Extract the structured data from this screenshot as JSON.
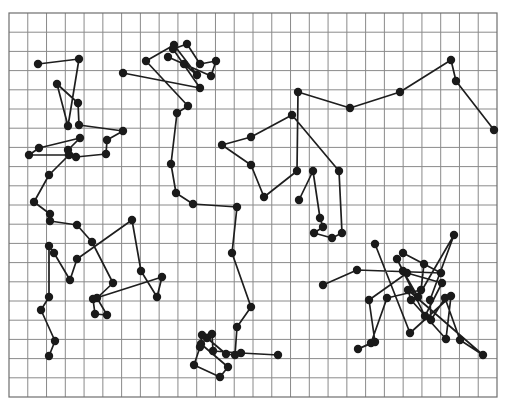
{
  "diagram": {
    "title": "",
    "type": "random-walk-trajectories-on-grid",
    "background": "#ffffff",
    "grid": {
      "x0": 9,
      "y0": 13,
      "x1": 497,
      "y1": 397,
      "cols": 26,
      "rows": 20,
      "color": "#8a8a8a"
    },
    "node_color": "#1a1a1a",
    "line_color": "#1e1e1e",
    "node_radius": 4.2,
    "trajectories": [
      {
        "name": "track-top-left",
        "points": [
          [
            38,
            64
          ],
          [
            79,
            59
          ],
          [
            68,
            126
          ],
          [
            57,
            84
          ],
          [
            78,
            103
          ],
          [
            79,
            125
          ],
          [
            123,
            131
          ],
          [
            107,
            140
          ],
          [
            106,
            154
          ],
          [
            76,
            157
          ],
          [
            68,
            150
          ],
          [
            80,
            138
          ],
          [
            39,
            148
          ],
          [
            29,
            155
          ],
          [
            69,
            155
          ],
          [
            49,
            175
          ],
          [
            34,
            202
          ],
          [
            50,
            214
          ]
        ]
      },
      {
        "name": "track-top-center",
        "points": [
          [
            123,
            73
          ],
          [
            200,
            88
          ],
          [
            173,
            49
          ],
          [
            187,
            44
          ],
          [
            200,
            64
          ],
          [
            216,
            61
          ],
          [
            211,
            76
          ],
          [
            168,
            57
          ],
          [
            184,
            64
          ],
          [
            197,
            75
          ],
          [
            174,
            45
          ],
          [
            146,
            61
          ],
          [
            188,
            106
          ],
          [
            177,
            113
          ],
          [
            171,
            164
          ],
          [
            176,
            193
          ],
          [
            193,
            204
          ],
          [
            237,
            207
          ],
          [
            232,
            253
          ],
          [
            251,
            307
          ],
          [
            237,
            327
          ],
          [
            235,
            355
          ],
          [
            226,
            354
          ],
          [
            207,
            338
          ],
          [
            201,
            344
          ],
          [
            228,
            367
          ],
          [
            220,
            377
          ],
          [
            194,
            365
          ],
          [
            200,
            347
          ],
          [
            202,
            335
          ],
          [
            212,
            334
          ],
          [
            213,
            351
          ],
          [
            241,
            353
          ],
          [
            278,
            355
          ]
        ]
      },
      {
        "name": "track-top-right",
        "points": [
          [
            494,
            130
          ],
          [
            456,
            81
          ],
          [
            451,
            60
          ],
          [
            400,
            92
          ],
          [
            350,
            108
          ],
          [
            298,
            92
          ],
          [
            297,
            171
          ],
          [
            264,
            197
          ],
          [
            251,
            165
          ],
          [
            222,
            145
          ],
          [
            251,
            137
          ],
          [
            292,
            115
          ],
          [
            339,
            171
          ],
          [
            342,
            233
          ],
          [
            332,
            238
          ],
          [
            314,
            233
          ],
          [
            323,
            227
          ],
          [
            320,
            218
          ],
          [
            313,
            171
          ],
          [
            299,
            200
          ]
        ]
      },
      {
        "name": "track-bottom-left",
        "points": [
          [
            50,
            221
          ],
          [
            77,
            225
          ],
          [
            92,
            242
          ],
          [
            113,
            283
          ],
          [
            97,
            298
          ],
          [
            107,
            315
          ],
          [
            95,
            314
          ],
          [
            93,
            299
          ],
          [
            162,
            277
          ],
          [
            157,
            297
          ],
          [
            141,
            271
          ],
          [
            132,
            220
          ],
          [
            77,
            259
          ],
          [
            70,
            280
          ],
          [
            54,
            253
          ],
          [
            49,
            246
          ],
          [
            49,
            297
          ],
          [
            41,
            310
          ],
          [
            55,
            341
          ],
          [
            49,
            356
          ]
        ]
      },
      {
        "name": "track-bottom-right",
        "points": [
          [
            323,
            285
          ],
          [
            357,
            270
          ],
          [
            441,
            273
          ],
          [
            403,
            253
          ],
          [
            424,
            264
          ],
          [
            421,
            290
          ],
          [
            387,
            298
          ],
          [
            371,
            343
          ],
          [
            358,
            349
          ],
          [
            375,
            342
          ],
          [
            369,
            300
          ],
          [
            407,
            273
          ],
          [
            442,
            283
          ],
          [
            425,
            316
          ],
          [
            397,
            259
          ],
          [
            403,
            271
          ],
          [
            418,
            297
          ],
          [
            454,
            235
          ],
          [
            430,
            300
          ],
          [
            431,
            320
          ],
          [
            445,
            298
          ],
          [
            460,
            340
          ],
          [
            483,
            355
          ],
          [
            408,
            290
          ],
          [
            411,
            300
          ],
          [
            446,
            339
          ],
          [
            451,
            296
          ],
          [
            410,
            333
          ],
          [
            375,
            244
          ]
        ]
      }
    ]
  }
}
